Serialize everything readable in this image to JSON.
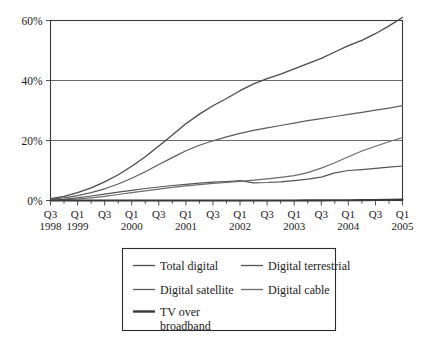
{
  "chart_data": {
    "type": "line",
    "title": "",
    "subtitle": "",
    "xlabel": "",
    "ylabel": "",
    "ylim": [
      0,
      62
    ],
    "yticks": [
      0,
      20,
      40,
      60
    ],
    "ytick_labels": [
      "0%",
      "20%",
      "40%",
      "60%"
    ],
    "grid": true,
    "legend_position": "below",
    "x": [
      "Q3 1998",
      "Q4 1998",
      "Q1 1999",
      "Q2 1999",
      "Q3 1999",
      "Q4 1999",
      "Q1 2000",
      "Q2 2000",
      "Q3 2000",
      "Q4 2000",
      "Q1 2001",
      "Q2 2001",
      "Q3 2001",
      "Q4 2001",
      "Q1 2002",
      "Q2 2002",
      "Q3 2002",
      "Q4 2002",
      "Q1 2003",
      "Q2 2003",
      "Q3 2003",
      "Q4 2003",
      "Q1 2004",
      "Q2 2004",
      "Q3 2004",
      "Q4 2004",
      "Q1 2005"
    ],
    "xtick_labels": [
      "Q3",
      "",
      "Q1",
      "",
      "Q3",
      "",
      "Q1",
      "",
      "Q3",
      "",
      "Q1",
      "",
      "Q3",
      "",
      "Q1",
      "",
      "Q3",
      "",
      "Q1",
      "",
      "Q3",
      "",
      "Q1",
      "",
      "Q3",
      "",
      "Q1"
    ],
    "xyear_labels": [
      {
        "index": 0,
        "label": "1998"
      },
      {
        "index": 2,
        "label": "1999"
      },
      {
        "index": 6,
        "label": "2000"
      },
      {
        "index": 10,
        "label": "2001"
      },
      {
        "index": 14,
        "label": "2002"
      },
      {
        "index": 18,
        "label": "2003"
      },
      {
        "index": 22,
        "label": "2004"
      },
      {
        "index": 26,
        "label": "2005"
      }
    ],
    "series": [
      {
        "name": "Total digital",
        "color": "#4a4a4a",
        "width": 1.3,
        "values": [
          0.6,
          1.4,
          2.6,
          4.2,
          6.2,
          8.6,
          11.4,
          14.6,
          18.2,
          21.8,
          25.6,
          28.8,
          31.6,
          34.0,
          36.6,
          38.9,
          40.6,
          42.1,
          43.9,
          45.6,
          47.4,
          49.5,
          51.6,
          53.4,
          55.6,
          58.2,
          61.0
        ]
      },
      {
        "name": "Digital terrestrial",
        "color": "#555555",
        "width": 1.2,
        "values": [
          0.1,
          0.4,
          0.9,
          1.5,
          2.1,
          2.8,
          3.4,
          4.0,
          4.5,
          5.0,
          5.4,
          5.8,
          6.1,
          6.3,
          6.6,
          5.9,
          6.0,
          6.2,
          6.6,
          7.1,
          7.8,
          9.2,
          10.0,
          10.3,
          10.7,
          11.1,
          11.5
        ]
      },
      {
        "name": "Digital satellite",
        "color": "#5c5c5c",
        "width": 1.2,
        "values": [
          0.4,
          0.9,
          1.6,
          2.6,
          3.9,
          5.5,
          7.4,
          9.6,
          12.0,
          14.3,
          16.6,
          18.4,
          19.9,
          21.2,
          22.4,
          23.4,
          24.2,
          25.0,
          25.8,
          26.6,
          27.3,
          28.0,
          28.7,
          29.4,
          30.1,
          30.8,
          31.6
        ]
      },
      {
        "name": "Digital cable",
        "color": "#6b6b6b",
        "width": 1.2,
        "values": [
          0.1,
          0.3,
          0.5,
          0.9,
          1.4,
          2.0,
          2.6,
          3.2,
          3.8,
          4.4,
          4.9,
          5.3,
          5.7,
          6.0,
          6.4,
          6.8,
          7.2,
          7.7,
          8.3,
          9.3,
          10.8,
          12.6,
          14.6,
          16.5,
          18.1,
          19.6,
          21.0
        ]
      },
      {
        "name": "TV over broadband",
        "color": "#3a3a3a",
        "width": 2.1,
        "values": [
          0.0,
          0.0,
          0.0,
          0.0,
          0.0,
          0.0,
          0.0,
          0.0,
          0.0,
          0.0,
          0.0,
          0.0,
          0.0,
          0.0,
          0.0,
          0.0,
          0.0,
          0.0,
          0.02,
          0.03,
          0.05,
          0.07,
          0.1,
          0.14,
          0.18,
          0.24,
          0.3
        ]
      }
    ]
  },
  "legend": {
    "entries": [
      {
        "label": "Total digital",
        "color": "#4a4a4a",
        "width": 1.3
      },
      {
        "label": "Digital terrestrial",
        "color": "#555555",
        "width": 1.3
      },
      {
        "label": "Digital satellite",
        "color": "#5c5c5c",
        "width": 1.3
      },
      {
        "label": "Digital cable",
        "color": "#6b6b6b",
        "width": 1.3
      },
      {
        "label": "TV over",
        "label2": "broadband",
        "color": "#3a3a3a",
        "width": 2.4
      }
    ]
  }
}
